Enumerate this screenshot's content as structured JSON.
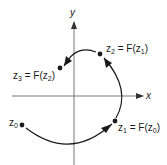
{
  "diagram": {
    "axes": {
      "x_label": "x",
      "y_label": "y"
    },
    "points": [
      {
        "id": "z0",
        "label_main": "z",
        "label_sub": "0",
        "rhs": ""
      },
      {
        "id": "z1",
        "label_main": "z",
        "label_sub": "1",
        "rhs_main": " = F(z",
        "rhs_sub": "0",
        "rhs_end": ")"
      },
      {
        "id": "z2",
        "label_main": "z",
        "label_sub": "2",
        "rhs_main": " = F(z",
        "rhs_sub": "1",
        "rhs_end": ")"
      },
      {
        "id": "z3",
        "label_main": "z",
        "label_sub": "3",
        "rhs_main": " = F(z",
        "rhs_sub": "2",
        "rhs_end": ")"
      }
    ],
    "colors": {
      "ink": "#1a1a1a",
      "axis": "#555555",
      "background": "#ffffff"
    }
  }
}
